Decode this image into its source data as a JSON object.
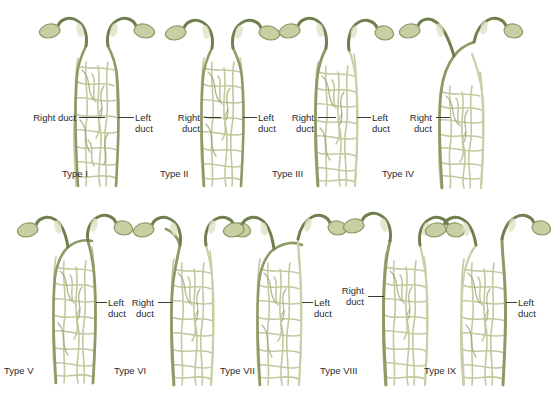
{
  "figure": {
    "background_color": "#ffffff",
    "label_text_color": "#2b2b2b",
    "leader_line_color": "#3a3a3a",
    "vessel_colors": {
      "duct_outline": "#6f7f4e",
      "duct_fill": "#b9c190",
      "duct_highlight": "#dfe3c6",
      "network_stroke": "#c3c99e",
      "network_stroke_dark": "#93a06a",
      "stump_fill": "#c8cfa2"
    }
  },
  "panels": [
    {
      "id": "type-1",
      "caption": "Type I",
      "labels": [
        {
          "name": "right-duct",
          "lines": [
            "Right duct"
          ]
        },
        {
          "name": "left-duct",
          "lines": [
            "Left",
            "duct"
          ]
        }
      ]
    },
    {
      "id": "type-2",
      "caption": "Type II",
      "labels": [
        {
          "name": "right-duct",
          "lines": [
            "Right",
            "duct"
          ]
        },
        {
          "name": "left-duct",
          "lines": [
            "Left",
            "duct"
          ]
        }
      ]
    },
    {
      "id": "type-3",
      "caption": "Type III",
      "labels": [
        {
          "name": "right-duct",
          "lines": [
            "Right",
            "duct"
          ]
        },
        {
          "name": "left-duct",
          "lines": [
            "Left",
            "duct"
          ]
        }
      ]
    },
    {
      "id": "type-4",
      "caption": "Type IV",
      "labels": [
        {
          "name": "right-duct",
          "lines": [
            "Right",
            "duct"
          ]
        }
      ]
    },
    {
      "id": "type-5",
      "caption": "Type V",
      "labels": [
        {
          "name": "left-duct",
          "lines": [
            "Left",
            "duct"
          ]
        }
      ]
    },
    {
      "id": "type-6",
      "caption": "Type VI",
      "labels": [
        {
          "name": "right-duct",
          "lines": [
            "Right",
            "duct"
          ]
        }
      ]
    },
    {
      "id": "type-7",
      "caption": "Type VII",
      "labels": [
        {
          "name": "left-duct",
          "lines": [
            "Left",
            "duct"
          ]
        }
      ]
    },
    {
      "id": "type-8",
      "caption": "Type VIII",
      "labels": [
        {
          "name": "right-duct",
          "lines": [
            "Right",
            "duct"
          ]
        }
      ]
    },
    {
      "id": "type-9",
      "caption": "Type IX",
      "labels": [
        {
          "name": "left-duct",
          "lines": [
            "Left",
            "duct"
          ]
        }
      ]
    }
  ]
}
